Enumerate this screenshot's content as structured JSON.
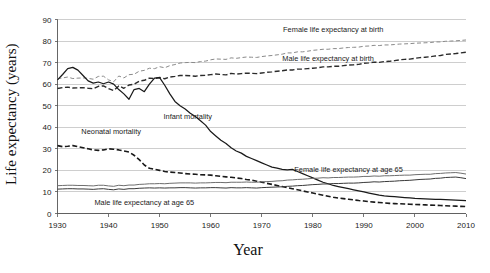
{
  "chart_data": {
    "type": "line",
    "title": "",
    "xlabel": "Year",
    "ylabel": "Life expectancy (years)",
    "xlim": [
      1930,
      2010
    ],
    "ylim": [
      0,
      90
    ],
    "xticks": [
      1930,
      1940,
      1950,
      1960,
      1970,
      1980,
      1990,
      2000,
      2010
    ],
    "yticks": [
      0,
      10,
      20,
      30,
      40,
      50,
      60,
      70,
      80,
      90
    ],
    "xtick_labels": [
      "1930",
      "1940",
      "1950",
      "1960",
      "1970",
      "1980",
      "1990",
      "2000",
      "2010"
    ],
    "ytick_labels": [
      "0",
      "10",
      "20",
      "30",
      "40",
      "50",
      "60",
      "70",
      "80",
      "90"
    ],
    "grid": true,
    "grid_axis": "y",
    "legend": "inline-annotations",
    "annotations": [
      {
        "text": "Female life expectancy at birth",
        "x": 1984,
        "y": 85.5,
        "anchor": "middle"
      },
      {
        "text": "Male life expectancy at birth",
        "x": 1983,
        "y": 72.0,
        "anchor": "middle"
      },
      {
        "text": "Infant mortality",
        "x": 1955.5,
        "y": 45.0,
        "anchor": "middle"
      },
      {
        "text": "Neonatal mortality",
        "x": 1940.5,
        "y": 38.0,
        "anchor": "middle"
      },
      {
        "text": "Female life expectancy at age 65",
        "x": 1987,
        "y": 20.6,
        "anchor": "middle"
      },
      {
        "text": "Male life expectancy at age 65",
        "x": 1947,
        "y": 5.2,
        "anchor": "middle"
      }
    ],
    "x": [
      1930,
      1931,
      1932,
      1933,
      1934,
      1935,
      1936,
      1937,
      1938,
      1939,
      1940,
      1941,
      1942,
      1943,
      1944,
      1945,
      1946,
      1947,
      1948,
      1949,
      1950,
      1951,
      1952,
      1953,
      1954,
      1955,
      1956,
      1957,
      1958,
      1959,
      1960,
      1961,
      1962,
      1963,
      1964,
      1965,
      1966,
      1967,
      1968,
      1969,
      1970,
      1971,
      1972,
      1973,
      1974,
      1975,
      1976,
      1977,
      1978,
      1979,
      1980,
      1981,
      1982,
      1983,
      1984,
      1985,
      1986,
      1987,
      1988,
      1989,
      1990,
      1991,
      1992,
      1993,
      1994,
      1995,
      1996,
      1997,
      1998,
      1999,
      2000,
      2001,
      2002,
      2003,
      2004,
      2005,
      2006,
      2007,
      2008,
      2009,
      2010
    ],
    "series": [
      {
        "name": "Female life expectancy at birth",
        "style": "dashed-light",
        "color": "#8a8a8a",
        "values": [
          62.5,
          62.9,
          63.3,
          62.6,
          62.8,
          62.9,
          62.7,
          62.3,
          63.6,
          63.7,
          62.0,
          61.1,
          63.8,
          62.9,
          64.4,
          64.6,
          66.0,
          66.4,
          67.4,
          67.2,
          68.1,
          67.6,
          68.6,
          69.1,
          69.8,
          70.0,
          70.1,
          70.0,
          70.5,
          70.7,
          71.3,
          71.7,
          71.6,
          71.5,
          72.2,
          72.0,
          72.3,
          72.6,
          72.5,
          72.4,
          72.8,
          73.1,
          73.3,
          73.6,
          73.9,
          74.5,
          74.5,
          75.0,
          75.0,
          75.3,
          75.7,
          75.9,
          76.2,
          76.2,
          76.5,
          76.5,
          76.8,
          77.0,
          77.1,
          77.2,
          77.6,
          77.7,
          78.0,
          77.9,
          78.2,
          78.2,
          78.4,
          78.6,
          78.7,
          78.8,
          79.0,
          79.1,
          79.2,
          79.3,
          79.6,
          79.6,
          79.9,
          80.0,
          80.1,
          80.3,
          80.5
        ]
      },
      {
        "name": "Male life expectancy at birth",
        "style": "dashed-dark",
        "color": "#2b2b2b",
        "values": [
          58.0,
          58.4,
          58.6,
          58.2,
          58.3,
          58.4,
          58.1,
          57.9,
          59.0,
          59.2,
          57.9,
          57.0,
          59.2,
          58.1,
          59.6,
          60.0,
          61.4,
          61.8,
          62.8,
          62.6,
          63.1,
          62.5,
          63.3,
          63.6,
          64.0,
          64.0,
          63.9,
          63.7,
          64.0,
          64.1,
          64.4,
          64.7,
          64.5,
          64.3,
          65.0,
          64.7,
          64.9,
          65.1,
          65.0,
          64.9,
          65.2,
          65.5,
          65.7,
          66.0,
          66.2,
          66.6,
          66.6,
          67.0,
          67.0,
          67.2,
          67.4,
          67.6,
          68.0,
          68.0,
          68.3,
          68.3,
          68.6,
          68.9,
          69.0,
          69.2,
          69.7,
          69.9,
          70.2,
          70.1,
          70.5,
          70.6,
          70.9,
          71.3,
          71.5,
          71.6,
          72.0,
          72.3,
          72.5,
          72.7,
          73.1,
          73.3,
          73.8,
          74.0,
          74.2,
          74.5,
          74.8
        ]
      },
      {
        "name": "Infant mortality",
        "style": "solid-dark",
        "color": "#1a1a1a",
        "values": [
          62.0,
          64.5,
          67.2,
          67.8,
          66.5,
          64.0,
          61.5,
          60.5,
          61.0,
          60.2,
          61.0,
          60.0,
          57.5,
          55.5,
          53.0,
          57.5,
          58.0,
          56.5,
          60.0,
          62.8,
          63.0,
          59.5,
          55.5,
          52.0,
          50.0,
          48.5,
          46.5,
          45.0,
          43.0,
          41.0,
          38.0,
          36.0,
          34.0,
          32.5,
          30.5,
          29.0,
          28.0,
          26.5,
          25.5,
          24.5,
          23.5,
          22.5,
          21.5,
          21.0,
          20.5,
          20.2,
          20.5,
          19.5,
          18.5,
          17.5,
          16.5,
          15.5,
          14.5,
          13.8,
          13.0,
          12.5,
          12.0,
          11.5,
          11.0,
          10.5,
          10.0,
          9.5,
          9.0,
          8.5,
          8.2,
          8.0,
          7.8,
          7.6,
          7.4,
          7.2,
          7.0,
          6.9,
          6.8,
          6.7,
          6.6,
          6.5,
          6.4,
          6.3,
          6.2,
          6.1,
          6.0
        ]
      },
      {
        "name": "Neonatal mortality",
        "style": "dashed-heavy",
        "color": "#1a1a1a",
        "values": [
          31.5,
          31.0,
          31.2,
          31.5,
          31.0,
          30.5,
          30.0,
          29.5,
          29.3,
          29.5,
          30.0,
          29.8,
          29.5,
          29.0,
          28.5,
          27.0,
          25.0,
          22.5,
          21.0,
          20.5,
          20.0,
          19.5,
          19.2,
          19.0,
          18.8,
          18.5,
          18.3,
          18.2,
          18.0,
          17.9,
          17.8,
          17.5,
          17.2,
          17.0,
          16.8,
          16.5,
          16.2,
          15.8,
          15.5,
          15.0,
          14.5,
          14.0,
          13.5,
          13.0,
          12.5,
          12.0,
          11.5,
          11.0,
          10.5,
          10.0,
          9.5,
          9.0,
          8.5,
          8.0,
          7.5,
          7.2,
          6.9,
          6.6,
          6.3,
          6.0,
          5.8,
          5.5,
          5.3,
          5.1,
          4.9,
          4.7,
          4.6,
          4.5,
          4.4,
          4.3,
          4.2,
          4.1,
          4.0,
          3.9,
          3.8,
          3.7,
          3.6,
          3.5,
          3.4,
          3.3,
          3.2
        ]
      },
      {
        "name": "Female life expectancy at age 65",
        "style": "solid-light",
        "color": "#6e6e6e",
        "values": [
          12.9,
          13.0,
          13.1,
          13.1,
          13.0,
          13.0,
          12.9,
          12.8,
          13.1,
          13.1,
          12.8,
          12.6,
          13.1,
          12.9,
          13.2,
          13.2,
          13.5,
          13.6,
          13.8,
          13.8,
          13.9,
          13.8,
          14.0,
          14.1,
          14.2,
          14.2,
          14.2,
          14.1,
          14.2,
          14.2,
          14.3,
          14.4,
          14.4,
          14.3,
          14.5,
          14.5,
          14.5,
          14.6,
          14.5,
          14.5,
          14.7,
          14.8,
          14.9,
          15.1,
          15.2,
          15.5,
          15.6,
          15.8,
          15.9,
          16.1,
          16.3,
          16.4,
          16.6,
          16.5,
          16.7,
          16.7,
          16.8,
          16.9,
          16.9,
          17.0,
          17.2,
          17.2,
          17.4,
          17.3,
          17.5,
          17.5,
          17.6,
          17.7,
          17.8,
          17.8,
          18.0,
          18.1,
          18.2,
          18.2,
          18.5,
          18.6,
          18.8,
          18.9,
          19.0,
          18.7,
          18.3
        ]
      },
      {
        "name": "Male life expectancy at age 65",
        "style": "solid-medium",
        "color": "#3a3a3a",
        "values": [
          11.3,
          11.4,
          11.5,
          11.5,
          11.4,
          11.4,
          11.3,
          11.2,
          11.4,
          11.5,
          11.2,
          11.0,
          11.4,
          11.2,
          11.5,
          11.5,
          11.7,
          11.8,
          11.9,
          11.8,
          11.9,
          11.8,
          11.9,
          11.9,
          12.0,
          12.0,
          11.9,
          11.8,
          11.9,
          11.9,
          12.0,
          12.0,
          11.9,
          11.8,
          12.0,
          11.9,
          11.9,
          12.0,
          11.9,
          11.8,
          12.0,
          12.1,
          12.2,
          12.3,
          12.4,
          12.6,
          12.7,
          12.9,
          13.0,
          13.2,
          13.4,
          13.5,
          13.7,
          13.7,
          13.9,
          13.9,
          14.0,
          14.1,
          14.1,
          14.2,
          14.4,
          14.5,
          14.7,
          14.6,
          14.8,
          14.9,
          15.0,
          15.2,
          15.3,
          15.4,
          15.6,
          15.8,
          15.9,
          16.0,
          16.3,
          16.4,
          16.7,
          16.8,
          16.9,
          16.6,
          16.2
        ]
      }
    ]
  }
}
